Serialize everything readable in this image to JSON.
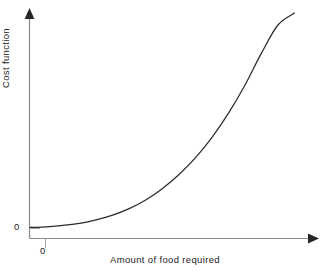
{
  "chart_data": {
    "type": "line",
    "title": "",
    "xlabel": "Amount of food required",
    "ylabel": "Cost function",
    "x_origin_tick_label": "0",
    "y_origin_tick_label": "0",
    "grid": false,
    "legend": "none",
    "axis_style": "arrow-ended",
    "xlim": [
      0,
      10
    ],
    "ylim": [
      0,
      10
    ],
    "xticks": [
      "0"
    ],
    "yticks": [
      "0"
    ],
    "series": [
      {
        "name": "Cost function",
        "shape": "convex-increasing",
        "x": [
          0.0,
          0.6,
          1.2,
          1.8,
          2.4,
          3.0,
          3.6,
          4.2,
          4.8,
          5.4,
          6.0,
          6.6,
          7.2,
          7.8,
          8.4,
          9.0,
          9.6
        ],
        "y": [
          0.05,
          0.08,
          0.14,
          0.24,
          0.4,
          0.62,
          0.92,
          1.32,
          1.84,
          2.48,
          3.26,
          4.2,
          5.32,
          6.62,
          8.1,
          9.4,
          9.95
        ]
      }
    ],
    "colors": {
      "curve": "#2b2b2b",
      "axis": "#8a8a8a",
      "tick": "#9a9a9a",
      "text": "#1b1b1b",
      "background": "#ffffff"
    }
  }
}
